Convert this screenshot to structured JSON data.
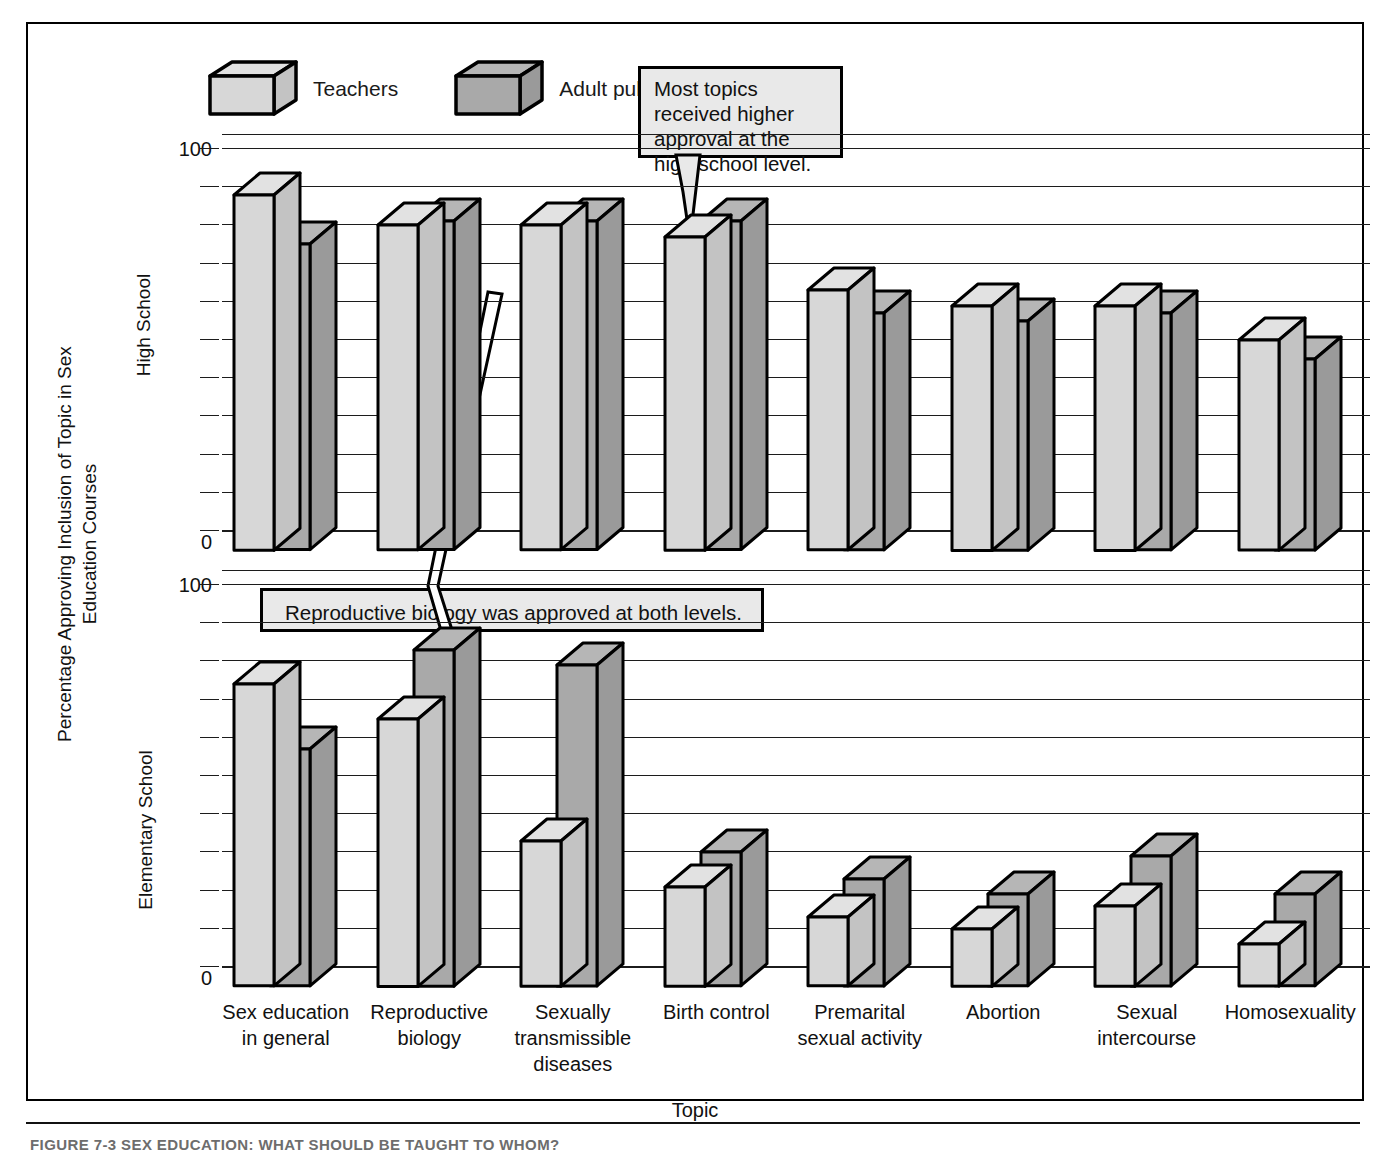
{
  "figure": {
    "caption": "FIGURE 7-3    SEX EDUCATION: WHAT SHOULD BE TAUGHT TO WHOM?"
  },
  "legend": {
    "items": [
      {
        "label": "Teachers",
        "icon": "cube-icon",
        "color": "#d7d7d7"
      },
      {
        "label": "Adult public",
        "icon": "cube-icon",
        "color": "#a9a9a9"
      }
    ]
  },
  "callouts": [
    {
      "id": "high-school-note",
      "text": "Most topics received higher approval at the high school level."
    },
    {
      "id": "reproductive-biology-note",
      "text": "Reproductive biology was approved at both levels."
    }
  ],
  "axes": {
    "y_title": "Percentage Approving Inclusion of Topic in Sex Education Courses",
    "x_title": "Topic",
    "panel_labels": {
      "top": "High School",
      "bottom": "Elementary School"
    },
    "tick_labels": [
      "100",
      "0"
    ]
  },
  "chart_data": {
    "type": "bar",
    "title": "Sex education: what should be taught to whom?",
    "xlabel": "Topic",
    "ylabel": "Percentage Approving Inclusion of Topic in Sex Education Courses",
    "ylim": [
      0,
      100
    ],
    "ytick_labels": [
      "0",
      "100"
    ],
    "grid": true,
    "grid_step": 10,
    "legend_position": "top-left",
    "categories": [
      "Sex education in general",
      "Reproductive biology",
      "Sexually transmissible diseases",
      "Birth control",
      "Premarital sexual activity",
      "Abortion",
      "Sexual intercourse",
      "Homosexuality"
    ],
    "panels": [
      {
        "name": "High School",
        "series": [
          {
            "name": "Teachers",
            "values": [
              93,
              85,
              85,
              82,
              68,
              64,
              64,
              55
            ]
          },
          {
            "name": "Adult public",
            "values": [
              80,
              86,
              86,
              86,
              62,
              60,
              62,
              50
            ]
          }
        ]
      },
      {
        "name": "Elementary School",
        "series": [
          {
            "name": "Teachers",
            "values": [
              79,
              70,
              38,
              26,
              18,
              15,
              21,
              11
            ]
          },
          {
            "name": "Adult public",
            "values": [
              62,
              88,
              84,
              35,
              28,
              24,
              34,
              24
            ]
          }
        ]
      }
    ]
  },
  "colors": {
    "teachers": "#d7d7d7",
    "adult_public": "#a9a9a9",
    "outline": "#000000",
    "gridline": "#1c1c1c",
    "callout_bg": "#e9e9e9"
  }
}
